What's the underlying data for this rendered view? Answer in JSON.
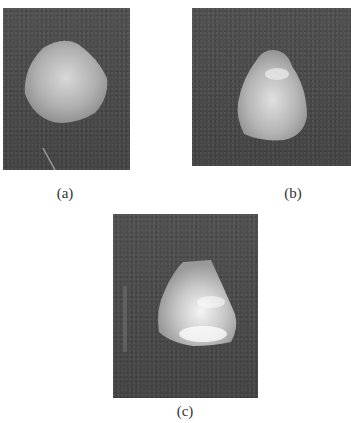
{
  "figure": {
    "panels": [
      {
        "id": "a",
        "label": "(a)",
        "description": "rounded pale stone on dark background"
      },
      {
        "id": "b",
        "label": "(b)",
        "description": "teardrop-shaped mottled stone on dark background"
      },
      {
        "id": "c",
        "label": "(c)",
        "description": "faceted translucent stone on dark background"
      }
    ]
  }
}
